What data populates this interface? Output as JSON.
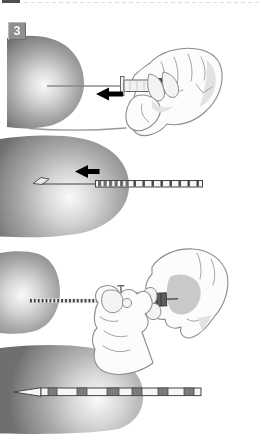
{
  "figure": {
    "step_badge": {
      "label": "3"
    },
    "colors": {
      "background": "#ffffff",
      "badge_bg": "#8f8f8f",
      "badge_text": "#ffffff",
      "arrow": "#000000",
      "outline": "#8c8c8c",
      "device_dark": "#5e5e5e",
      "wire_dark": "#454545",
      "band_fill": "#f6f6f6",
      "segment_fill": "#7b7b7b",
      "hand_fill": "#fcfcfc",
      "tissue_edge": "#747474",
      "tissue_highlight": "#fafafa",
      "crop_bar": "#4f4f4f"
    },
    "icons": [
      "arrow-left-icon",
      "syringe-icon",
      "hand-icon",
      "breast-shape",
      "hookwire-icon",
      "marker-band-icon"
    ]
  }
}
